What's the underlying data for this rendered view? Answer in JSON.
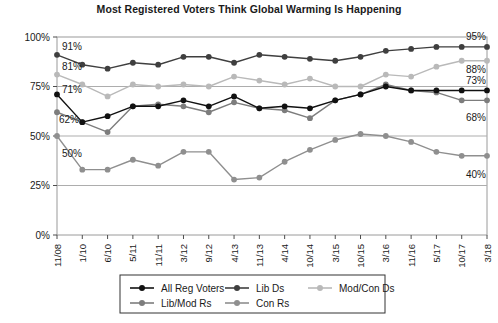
{
  "chart_data": {
    "type": "line",
    "title": "Most Registered Voters Think Global Warming Is Happening",
    "xlabel": "",
    "ylabel": "",
    "ylim": [
      0,
      100
    ],
    "yticks": [
      0,
      25,
      50,
      75,
      100
    ],
    "ytick_labels": [
      "0%",
      "25%",
      "50%",
      "75%",
      "100%"
    ],
    "grid": "horizontal",
    "legend_position": "bottom",
    "categories": [
      "11/08",
      "1/10",
      "6/10",
      "5/11",
      "11/11",
      "3/12",
      "9/12",
      "4/13",
      "11/13",
      "4/14",
      "10/14",
      "3/15",
      "10/15",
      "3/16",
      "11/16",
      "5/17",
      "10/17",
      "3/18"
    ],
    "series": [
      {
        "name": "All Reg Voters",
        "color": "#111111",
        "values": [
          71,
          57,
          60,
          65,
          65,
          68,
          65,
          70,
          64,
          65,
          64,
          68,
          71,
          75,
          73,
          73,
          73,
          73
        ],
        "start_label": "71%",
        "end_label": "73%"
      },
      {
        "name": "Lib Ds",
        "color": "#3f3f3f",
        "values": [
          91,
          86,
          84,
          87,
          86,
          90,
          90,
          87,
          91,
          90,
          89,
          88,
          90,
          93,
          94,
          95,
          95,
          95
        ],
        "start_label": "91%",
        "end_label": "95%"
      },
      {
        "name": "Mod/Con Ds",
        "color": "#b9b9b9",
        "values": [
          81,
          76,
          70,
          76,
          75,
          76,
          75,
          80,
          78,
          76,
          79,
          75,
          75,
          81,
          80,
          85,
          88,
          88
        ],
        "start_label": "81%",
        "end_label": "88%"
      },
      {
        "name": "Lib/Mod Rs",
        "color": "#7d7d7d",
        "values": [
          62,
          57,
          52,
          65,
          66,
          65,
          62,
          67,
          64,
          63,
          59,
          68,
          71,
          76,
          73,
          72,
          68,
          68
        ],
        "start_label": "62%",
        "end_label": "68%"
      },
      {
        "name": "Con Rs",
        "color": "#8f8f8f",
        "values": [
          50,
          33,
          33,
          38,
          35,
          42,
          42,
          28,
          29,
          37,
          43,
          48,
          51,
          50,
          47,
          42,
          40,
          40
        ],
        "start_label": "50%",
        "end_label": "40%"
      }
    ],
    "left_annotations": [
      "91%",
      "81%",
      "71%",
      "62%",
      "50%"
    ],
    "right_annotations": [
      "95%",
      "88%",
      "73%",
      "68%",
      "40%"
    ]
  },
  "legend": {
    "items": [
      {
        "label": "All Reg Voters"
      },
      {
        "label": "Lib Ds"
      },
      {
        "label": "Mod/Con Ds"
      },
      {
        "label": "Lib/Mod Rs"
      },
      {
        "label": "Con Rs"
      }
    ]
  }
}
